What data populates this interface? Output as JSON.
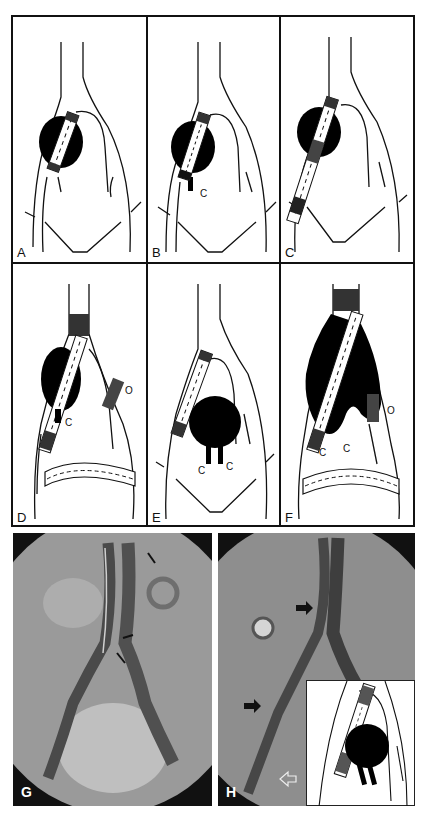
{
  "figure": {
    "panels": [
      {
        "id": "A",
        "label": "A",
        "type": "schematic"
      },
      {
        "id": "B",
        "label": "B",
        "type": "schematic",
        "annotations": [
          "C"
        ]
      },
      {
        "id": "C",
        "label": "C",
        "type": "schematic"
      },
      {
        "id": "D",
        "label": "D",
        "type": "schematic",
        "annotations": [
          "C",
          "O"
        ]
      },
      {
        "id": "E",
        "label": "E",
        "type": "schematic",
        "annotations": [
          "C",
          "C"
        ]
      },
      {
        "id": "F",
        "label": "F",
        "type": "schematic",
        "annotations": [
          "C",
          "C",
          "O"
        ]
      },
      {
        "id": "G",
        "label": "G",
        "type": "angiogram"
      },
      {
        "id": "H",
        "label": "H",
        "type": "angiogram-with-inset"
      }
    ],
    "colors": {
      "line": "#111111",
      "aneurysm_fill": "#000000",
      "background": "#ffffff",
      "photo_bg": "#8a8a8a",
      "photo_frame": "#111111"
    }
  }
}
